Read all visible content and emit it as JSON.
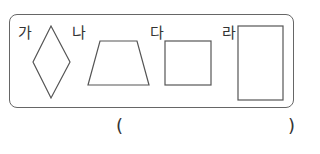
{
  "figures": [
    {
      "label": "가",
      "shape": "rhombus"
    },
    {
      "label": "나",
      "shape": "trapezoid"
    },
    {
      "label": "다",
      "shape": "square"
    },
    {
      "label": "라",
      "shape": "rectangle"
    }
  ],
  "answer": {
    "open": "(",
    "close": ")",
    "value": ""
  }
}
